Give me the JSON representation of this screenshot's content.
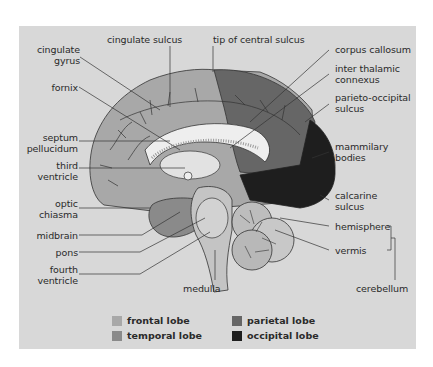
{
  "diagram": {
    "colors": {
      "panel_bg": "#d8d8d8",
      "frontal": "#a8a8a8",
      "temporal": "#8a8a8a",
      "parietal": "#666666",
      "occipital": "#1e1e1e",
      "corpus_callosum": "#eeeeee",
      "brainstem": "#c4c4c4",
      "cerebellum": "#bdbdbd"
    },
    "labels_left": [
      {
        "id": "cingulate-gyrus",
        "text": "cingulate\ngyrus"
      },
      {
        "id": "fornix",
        "text": "fornix"
      },
      {
        "id": "septum-pellucidum",
        "text": "septum\npellucidum"
      },
      {
        "id": "third-ventricle",
        "text": "third\nventricle"
      },
      {
        "id": "optic-chiasma",
        "text": "optic\nchiasma"
      },
      {
        "id": "midbrain",
        "text": "midbrain"
      },
      {
        "id": "pons",
        "text": "pons"
      },
      {
        "id": "fourth-ventricle",
        "text": "fourth\nventricle"
      }
    ],
    "labels_top": [
      {
        "id": "cingulate-sulcus",
        "text": "cingulate sulcus"
      },
      {
        "id": "tip-of-central-sulcus",
        "text": "tip of central sulcus"
      }
    ],
    "labels_right": [
      {
        "id": "corpus-callosum",
        "text": "corpus callosum"
      },
      {
        "id": "inter-thalamic-connexus",
        "text": "inter thalamic\nconnexus"
      },
      {
        "id": "parieto-occipital-sulcus",
        "text": "parieto-occipital\nsulcus"
      },
      {
        "id": "mammilary-bodies",
        "text": "mammilary\nbodies"
      },
      {
        "id": "calcarine-sulcus",
        "text": "calcarine\nsulcus"
      },
      {
        "id": "hemisphere",
        "text": "hemisphere"
      },
      {
        "id": "vermis",
        "text": "vermis"
      }
    ],
    "labels_bottom": [
      {
        "id": "medulla",
        "text": "medulla"
      },
      {
        "id": "cerebellum",
        "text": "cerebellum"
      }
    ],
    "legend": [
      {
        "id": "frontal-lobe",
        "label": "frontal lobe",
        "color": "#a8a8a8"
      },
      {
        "id": "temporal-lobe",
        "label": "temporal lobe",
        "color": "#8a8a8a"
      },
      {
        "id": "parietal-lobe",
        "label": "parietal lobe",
        "color": "#666666"
      },
      {
        "id": "occipital-lobe",
        "label": "occipital lobe",
        "color": "#1e1e1e"
      }
    ]
  }
}
